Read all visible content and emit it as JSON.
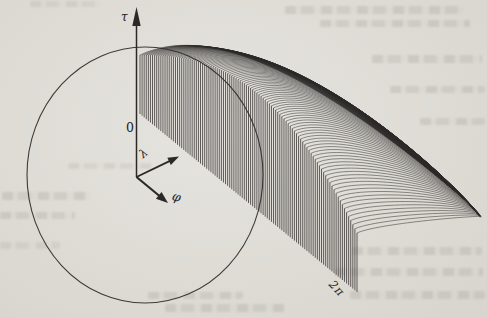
{
  "figure": {
    "background_color": "#e3e1db",
    "line_color": "#2b2927",
    "labels": {
      "tau": "τ",
      "origin_zero": "0",
      "lambda": "λ",
      "phi": "φ",
      "phi_end": "2π"
    }
  },
  "chart_data": {
    "type": "line",
    "subtype": "hidden-line 3D waterfall surface plot (scanned book/paper figure)",
    "title": "",
    "xlabel": "φ",
    "ylabel": "τ",
    "depth_label": "λ",
    "ticks": {
      "origin": "0",
      "front_axis_end": "2π"
    },
    "front_axis_range": [
      "0",
      "2π"
    ],
    "domain_outline": "circle drawn in the (φ, λ) base plane, partly passing over the surface",
    "series_description": "Dense family of ~105 surface profile curves: a high plateau near the τ axis that plunges along a steep front face (vertical drop lines from each profile to the slanted φ baseline ending at 2π) and sweeps right into a folded low tail where all profiles converge.",
    "profile_count": 105,
    "geometry": {
      "canvas": [
        487,
        318
      ],
      "front_edge_start": [
        140,
        114
      ],
      "front_edge_end": [
        357,
        292
      ],
      "front_top_start_y": 55,
      "front_top_drop": 178,
      "front_top_power": 2.5,
      "crest": {
        "x0": 230,
        "dx": 235,
        "xpow": 1.1,
        "y0": 38,
        "dy": 158,
        "ypow": 1.5
      },
      "tail": {
        "x0": 469,
        "dx": 11,
        "y0": 203,
        "dy": 14
      },
      "lambda_dir": [
        0.9063,
        -0.4226
      ],
      "cp1_len": [
        60,
        25
      ],
      "cp2_offset": {
        "dx0": 55,
        "dxt": -25,
        "dy0": 8,
        "dyt": 10
      },
      "circle": {
        "cx": 145,
        "cy": 175,
        "rx": 118,
        "ry": 128
      },
      "tau_axis": {
        "x": 136.5,
        "y_top": 7,
        "y_bottom": 177
      },
      "lambda_arrow": {
        "from": [
          136.5,
          177
        ],
        "to": [
          179,
          156.5
        ]
      },
      "phi_arrow": {
        "from": [
          136.5,
          177
        ],
        "to": [
          168,
          203
        ]
      },
      "stroke": {
        "curtain": 0.8,
        "flank": 0.58,
        "outline": 1.1,
        "axis": 1.5,
        "frame": 2.2
      }
    }
  }
}
